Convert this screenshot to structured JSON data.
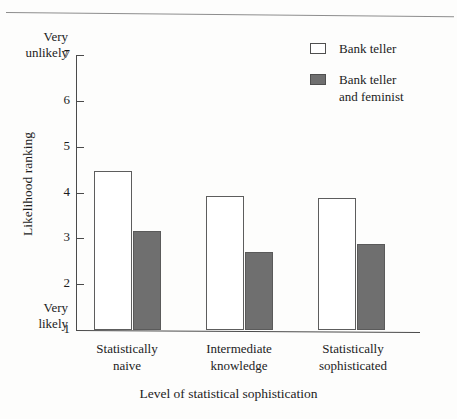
{
  "chart_data": {
    "type": "bar",
    "title": "",
    "xlabel": "Level of statistical sophistication",
    "ylabel": "Likelihood ranking",
    "categories": [
      "Statistically\nnaive",
      "Intermediate\nknowledge",
      "Statistically\nsophisticated"
    ],
    "series": [
      {
        "name": "Bank teller",
        "values": [
          4.47,
          3.92,
          3.89
        ],
        "color": "#ffffff"
      },
      {
        "name": "Bank teller\nand feminist",
        "values": [
          3.16,
          2.71,
          2.88
        ],
        "color": "#6f6f6f"
      }
    ],
    "ylim": [
      1,
      7
    ],
    "yticks": [
      7,
      6,
      5,
      4,
      3,
      2,
      1
    ],
    "ytick_labels": [
      "7",
      "6",
      "5",
      "4",
      "3",
      "2",
      "1"
    ],
    "y_axis_endpoints": {
      "top": "Very\nunlikely",
      "bottom": "Very\nlikely"
    },
    "grid": false,
    "legend_position": "top-right",
    "legend_entries": [
      "Bank teller",
      "Bank teller\nand feminist"
    ]
  },
  "axis": {
    "ylabel": "Likelihood ranking",
    "xlabel": "Level of statistical sophistication",
    "endpoint_top": "Very\nunlikely",
    "endpoint_bottom": "Very\nlikely"
  },
  "ticks": {
    "t7": "7",
    "t6": "6",
    "t5": "5",
    "t4": "4",
    "t3": "3",
    "t2": "2",
    "t1": "1"
  },
  "categories": {
    "c0": "Statistically\nnaive",
    "c1": "Intermediate\nknowledge",
    "c2": "Statistically\nsophisticated"
  },
  "legend": {
    "item0": "Bank teller",
    "item1": "Bank teller\nand feminist"
  },
  "colors": {
    "bar_light": "#ffffff",
    "bar_dark": "#6f6f6f",
    "axis": "#4a4a4a",
    "text": "#1c1c1c"
  }
}
